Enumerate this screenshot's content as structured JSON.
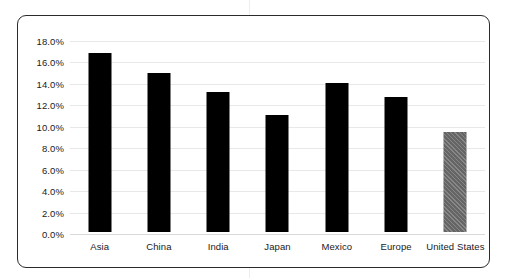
{
  "chart_data": {
    "type": "bar",
    "title": "",
    "subtitle": "",
    "xlabel": "",
    "ylabel": "",
    "categories": [
      "Asia",
      "China",
      "India",
      "Japan",
      "Mexico",
      "Europe",
      "United States"
    ],
    "values": [
      16.7,
      14.8,
      13.1,
      10.9,
      13.9,
      12.6,
      9.3
    ],
    "value_format": "percent",
    "ylim": [
      0.0,
      18.0
    ],
    "y_tick_values": [
      18.0,
      16.0,
      14.0,
      12.0,
      10.0,
      8.0,
      6.0,
      4.0,
      2.0,
      0.0
    ],
    "y_tick_labels": [
      "18.0%",
      "16.0%",
      "14.0%",
      "12.0%",
      "10.0%",
      "8.0%",
      "6.0%",
      "4.0%",
      "2.0%",
      "0.0%"
    ],
    "grid": true,
    "legend": false,
    "legend_position": "none",
    "series": [
      {
        "name": "",
        "values": [
          16.7,
          14.8,
          13.1,
          10.9,
          13.9,
          12.6,
          9.3
        ],
        "bar_colors": [
          "#000000",
          "#000000",
          "#000000",
          "#000000",
          "#000000",
          "#000000",
          "#707070"
        ],
        "bar_styles": [
          "solid",
          "solid",
          "solid",
          "solid",
          "solid",
          "solid",
          "hatched"
        ]
      }
    ],
    "annotations": []
  },
  "colors": {
    "bar_default": "#000000",
    "bar_highlight": "#707070",
    "grid": "#e8e8e8",
    "border": "#2b2b2b",
    "text": "#1a1a1a",
    "background": "#ffffff"
  }
}
